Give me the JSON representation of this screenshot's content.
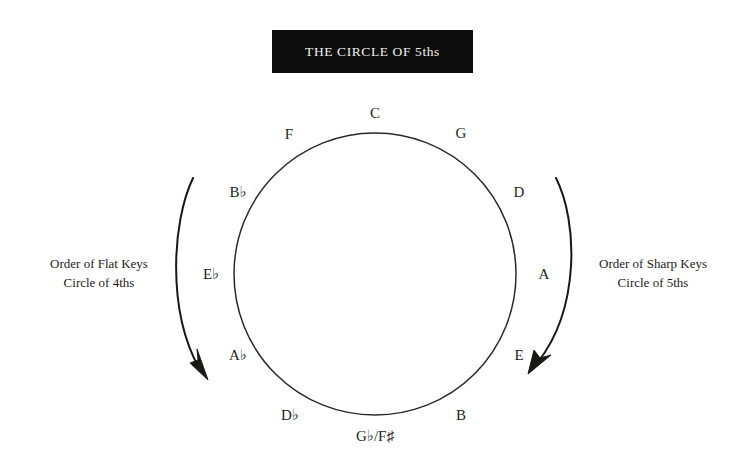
{
  "title": {
    "text": "THE CIRCLE OF 5ths",
    "banner_color": "#0d0c0c",
    "text_color": "#f2f0ee"
  },
  "diagram": {
    "type": "circle-of-fifths",
    "stroke_color": "#2b2828",
    "background_color": "#ffffff",
    "circle": {
      "cx": 375,
      "cy": 274,
      "r": 141
    }
  },
  "notes": [
    {
      "name": "note-c",
      "label": "C",
      "x": 375,
      "y": 113,
      "angle_deg": 0
    },
    {
      "name": "note-g",
      "label": "G",
      "x": 461,
      "y": 133,
      "angle_deg": 30
    },
    {
      "name": "note-d",
      "label": "D",
      "x": 519,
      "y": 192,
      "angle_deg": 60
    },
    {
      "name": "note-a",
      "label": "A",
      "x": 544,
      "y": 274,
      "angle_deg": 90
    },
    {
      "name": "note-e",
      "label": "E",
      "x": 519,
      "y": 355,
      "angle_deg": 120
    },
    {
      "name": "note-b",
      "label": "B",
      "x": 461,
      "y": 415,
      "angle_deg": 150
    },
    {
      "name": "note-gb-fs",
      "label": "G♭/F♯",
      "x": 375,
      "y": 436,
      "angle_deg": 180
    },
    {
      "name": "note-db",
      "label": "D♭",
      "x": 290,
      "y": 415,
      "angle_deg": 210
    },
    {
      "name": "note-ab",
      "label": "A♭",
      "x": 238,
      "y": 355,
      "angle_deg": 240
    },
    {
      "name": "note-eb",
      "label": "E♭",
      "x": 211,
      "y": 274,
      "angle_deg": 270
    },
    {
      "name": "note-bb",
      "label": "B♭",
      "x": 238,
      "y": 192,
      "angle_deg": 300
    },
    {
      "name": "note-f",
      "label": "F",
      "x": 289,
      "y": 134,
      "angle_deg": 330
    }
  ],
  "captions": {
    "flat": {
      "name": "flat-keys-caption",
      "line1": "Order of Flat Keys",
      "line2": "Circle of 4ths",
      "x": 99,
      "y": 274
    },
    "sharp": {
      "name": "sharp-keys-caption",
      "line1": "Order of Sharp Keys",
      "line2": "Circle of 5ths",
      "x": 653,
      "y": 274
    }
  },
  "arrows": {
    "flat_arrow": {
      "name": "flat-direction-arrow",
      "description": "curved arrow on left pointing downward (counter-clockwise order of flats)",
      "start": {
        "x": 193,
        "y": 178
      },
      "end": {
        "x": 206,
        "y": 377
      }
    },
    "sharp_arrow": {
      "name": "sharp-direction-arrow",
      "description": "curved arrow on right pointing downward (clockwise order of sharps)",
      "start": {
        "x": 556,
        "y": 178
      },
      "end": {
        "x": 543,
        "y": 372
      }
    }
  }
}
